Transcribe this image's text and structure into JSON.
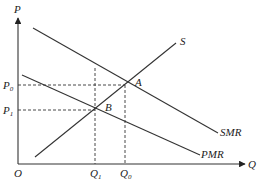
{
  "diagram": {
    "axes": {
      "y_label": "P",
      "x_label": "Q",
      "origin_label": "O"
    },
    "price_levels": [
      {
        "label": "P",
        "sub": "0"
      },
      {
        "label": "P",
        "sub": "1"
      }
    ],
    "quantity_levels": [
      {
        "label": "Q",
        "sub": "1"
      },
      {
        "label": "Q",
        "sub": "0"
      }
    ],
    "curves": {
      "supply": "S",
      "social_marginal_revenue": "SMR",
      "private_marginal_revenue": "PMR"
    },
    "points": {
      "a": "A",
      "b": "B"
    }
  }
}
